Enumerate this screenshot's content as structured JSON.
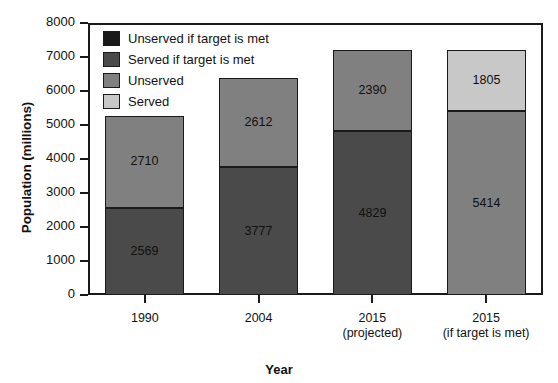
{
  "chart_data": {
    "type": "bar",
    "stacked": true,
    "title": "",
    "xlabel": "Year",
    "ylabel": "Population (millions)",
    "ylim": [
      0,
      8000
    ],
    "yticks": [
      0,
      1000,
      2000,
      3000,
      4000,
      5000,
      6000,
      7000,
      8000
    ],
    "ytick_labels": [
      "0",
      "1000",
      "2000",
      "3000",
      "4000",
      "5000",
      "6000",
      "7000",
      "8000"
    ],
    "grid": false,
    "legend_position": "upper-left-inside",
    "categories": [
      "1990",
      "2004",
      "2015",
      "2015"
    ],
    "category_sublabels": [
      "",
      "",
      "(projected)",
      "(if target is met)"
    ],
    "series": [
      {
        "name": "Served",
        "color": "#c8c8c8",
        "values": [
          null,
          null,
          null,
          1805
        ]
      },
      {
        "name": "Unserved",
        "color": "#808080",
        "values": [
          2710,
          2612,
          2390,
          5414
        ]
      },
      {
        "name": "Served if target is met",
        "color": "#4a4a4a",
        "values": [
          2569,
          3777,
          4829,
          null
        ]
      },
      {
        "name": "Unserved if target is met",
        "color": "#1a1a1a",
        "values": [
          null,
          null,
          null,
          null
        ]
      }
    ],
    "bars": [
      {
        "category": "1990",
        "sublabel": "",
        "total": 5279,
        "segments": [
          {
            "label": "2710",
            "value": 2710,
            "series": "Unserved",
            "color": "#808080"
          },
          {
            "label": "2569",
            "value": 2569,
            "series": "Served if target is met",
            "color": "#4a4a4a"
          }
        ]
      },
      {
        "category": "2004",
        "sublabel": "",
        "total": 6389,
        "segments": [
          {
            "label": "2612",
            "value": 2612,
            "series": "Unserved",
            "color": "#808080"
          },
          {
            "label": "3777",
            "value": 3777,
            "series": "Served if target is met",
            "color": "#4a4a4a"
          }
        ]
      },
      {
        "category": "2015",
        "sublabel": "(projected)",
        "total": 7219,
        "segments": [
          {
            "label": "2390",
            "value": 2390,
            "series": "Unserved",
            "color": "#808080"
          },
          {
            "label": "4829",
            "value": 4829,
            "series": "Served if target is met",
            "color": "#4a4a4a"
          }
        ]
      },
      {
        "category": "2015",
        "sublabel": "(if target is met)",
        "total": 7219,
        "segments": [
          {
            "label": "1805",
            "value": 1805,
            "series": "Served",
            "color": "#c8c8c8"
          },
          {
            "label": "5414",
            "value": 5414,
            "series": "Unserved",
            "color": "#808080"
          }
        ]
      }
    ],
    "legend": [
      {
        "label": "Unserved if target is met",
        "color": "#1a1a1a"
      },
      {
        "label": "Served if target is met",
        "color": "#4a4a4a"
      },
      {
        "label": "Unserved",
        "color": "#808080"
      },
      {
        "label": "Served",
        "color": "#c8c8c8"
      }
    ]
  }
}
